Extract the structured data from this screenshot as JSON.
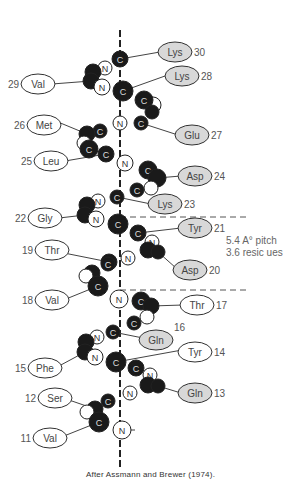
{
  "caption": "After Assmann and Brewer (1974).",
  "annotation": {
    "line1": "5.4 A° pitch",
    "line2": "3.6 resic ues"
  },
  "colors": {
    "hydrophobic_fill": "#ffffff",
    "hydrophilic_fill": "#d8d8d8",
    "atom_dark": "#1a1a1a",
    "line": "#444444"
  },
  "residues": [
    {
      "num": "30",
      "name": "Lys",
      "side": "right",
      "shaded": true,
      "cx": 175,
      "cy": 52,
      "num_pos": "after"
    },
    {
      "num": "28",
      "name": "Lys",
      "side": "right",
      "shaded": true,
      "cx": 182,
      "cy": 76,
      "num_pos": "after"
    },
    {
      "num": "29",
      "name": "Val",
      "side": "left",
      "shaded": false,
      "cx": 38,
      "cy": 84,
      "num_pos": "before"
    },
    {
      "num": "26",
      "name": "Met",
      "side": "left",
      "shaded": false,
      "cx": 44,
      "cy": 125,
      "num_pos": "before"
    },
    {
      "num": "27",
      "name": "Glu",
      "side": "right",
      "shaded": true,
      "cx": 192,
      "cy": 135,
      "num_pos": "after"
    },
    {
      "num": "25",
      "name": "Leu",
      "side": "left",
      "shaded": false,
      "cx": 51,
      "cy": 161,
      "num_pos": "before"
    },
    {
      "num": "24",
      "name": "Asp",
      "side": "right",
      "shaded": true,
      "cx": 195,
      "cy": 176,
      "num_pos": "after"
    },
    {
      "num": "23",
      "name": "Lys",
      "side": "right",
      "shaded": true,
      "cx": 165,
      "cy": 204,
      "num_pos": "after"
    },
    {
      "num": "22",
      "name": "Gly",
      "side": "left",
      "shaded": false,
      "cx": 45,
      "cy": 218,
      "num_pos": "before"
    },
    {
      "num": "21",
      "name": "Tyr",
      "side": "right",
      "shaded": true,
      "cx": 195,
      "cy": 228,
      "num_pos": "after"
    },
    {
      "num": "19",
      "name": "Thr",
      "side": "left",
      "shaded": false,
      "cx": 52,
      "cy": 250,
      "num_pos": "before"
    },
    {
      "num": "20",
      "name": "Asp",
      "side": "right",
      "shaded": true,
      "cx": 190,
      "cy": 270,
      "num_pos": "after"
    },
    {
      "num": "18",
      "name": "Val",
      "side": "left",
      "shaded": false,
      "cx": 52,
      "cy": 300,
      "num_pos": "before"
    },
    {
      "num": "17",
      "name": "Thr",
      "side": "right",
      "shaded": false,
      "cx": 197,
      "cy": 305,
      "num_pos": "after"
    },
    {
      "num": "16",
      "name": "Gln",
      "side": "right",
      "shaded": true,
      "cx": 156,
      "cy": 340,
      "num_pos": "above-after"
    },
    {
      "num": "14",
      "name": "Tyr",
      "side": "right",
      "shaded": false,
      "cx": 195,
      "cy": 352,
      "num_pos": "after"
    },
    {
      "num": "15",
      "name": "Phe",
      "side": "left",
      "shaded": false,
      "cx": 45,
      "cy": 368,
      "num_pos": "before"
    },
    {
      "num": "13",
      "name": "Gln",
      "side": "right",
      "shaded": true,
      "cx": 195,
      "cy": 393,
      "num_pos": "after"
    },
    {
      "num": "12",
      "name": "Ser",
      "side": "left",
      "shaded": false,
      "cx": 55,
      "cy": 398,
      "num_pos": "before"
    },
    {
      "num": "11",
      "name": "Val",
      "side": "left",
      "shaded": false,
      "cx": 50,
      "cy": 438,
      "num_pos": "before"
    }
  ],
  "atoms": [
    {
      "el": "C",
      "x": 120,
      "y": 59,
      "r": 8,
      "dark": true
    },
    {
      "el": "N",
      "x": 105,
      "y": 68,
      "r": 7,
      "dark": false
    },
    {
      "el": "",
      "x": 93,
      "y": 72,
      "r": 8,
      "dark": true
    },
    {
      "el": "",
      "x": 91,
      "y": 81,
      "r": 8,
      "dark": true
    },
    {
      "el": "N",
      "x": 102,
      "y": 87,
      "r": 8,
      "dark": false
    },
    {
      "el": "C",
      "x": 123,
      "y": 91,
      "r": 10,
      "dark": true
    },
    {
      "el": "",
      "x": 153,
      "y": 105,
      "r": 8,
      "dark": false
    },
    {
      "el": "C",
      "x": 144,
      "y": 100,
      "r": 9,
      "dark": true
    },
    {
      "el": "",
      "x": 152,
      "y": 112,
      "r": 7,
      "dark": true
    },
    {
      "el": "N",
      "x": 120,
      "y": 123,
      "r": 7,
      "dark": false
    },
    {
      "el": "C",
      "x": 141,
      "y": 123,
      "r": 7,
      "dark": true
    },
    {
      "el": "C",
      "x": 100,
      "y": 131,
      "r": 7,
      "dark": true
    },
    {
      "el": "",
      "x": 87,
      "y": 134,
      "r": 8,
      "dark": true
    },
    {
      "el": "",
      "x": 84,
      "y": 143,
      "r": 7,
      "dark": false
    },
    {
      "el": "C",
      "x": 89,
      "y": 149,
      "r": 9,
      "dark": true
    },
    {
      "el": "C",
      "x": 106,
      "y": 154,
      "r": 8,
      "dark": true
    },
    {
      "el": "N",
      "x": 125,
      "y": 163,
      "r": 8,
      "dark": false
    },
    {
      "el": "C",
      "x": 148,
      "y": 170,
      "r": 9,
      "dark": true
    },
    {
      "el": "",
      "x": 157,
      "y": 178,
      "r": 9,
      "dark": true
    },
    {
      "el": "",
      "x": 151,
      "y": 188,
      "r": 7,
      "dark": false
    },
    {
      "el": "C",
      "x": 137,
      "y": 190,
      "r": 7,
      "dark": true
    },
    {
      "el": "C",
      "x": 117,
      "y": 197,
      "r": 7,
      "dark": true
    },
    {
      "el": "N",
      "x": 98,
      "y": 201,
      "r": 7,
      "dark": false
    },
    {
      "el": "",
      "x": 87,
      "y": 205,
      "r": 8,
      "dark": true
    },
    {
      "el": "",
      "x": 85,
      "y": 215,
      "r": 8,
      "dark": true
    },
    {
      "el": "N",
      "x": 96,
      "y": 219,
      "r": 8,
      "dark": false
    },
    {
      "el": "C",
      "x": 118,
      "y": 224,
      "r": 10,
      "dark": true
    },
    {
      "el": "C",
      "x": 138,
      "y": 233,
      "r": 8,
      "dark": true
    },
    {
      "el": "N",
      "x": 152,
      "y": 242,
      "r": 7,
      "dark": false
    },
    {
      "el": "",
      "x": 148,
      "y": 250,
      "r": 8,
      "dark": true
    },
    {
      "el": "",
      "x": 158,
      "y": 252,
      "r": 7,
      "dark": true
    },
    {
      "el": "N",
      "x": 128,
      "y": 258,
      "r": 7,
      "dark": false
    },
    {
      "el": "",
      "x": 109,
      "y": 262,
      "r": 8,
      "dark": true
    },
    {
      "el": "C",
      "x": 108,
      "y": 264,
      "r": 7,
      "dark": true
    },
    {
      "el": "",
      "x": 92,
      "y": 273,
      "r": 8,
      "dark": true
    },
    {
      "el": "",
      "x": 86,
      "y": 276,
      "r": 7,
      "dark": false
    },
    {
      "el": "C",
      "x": 98,
      "y": 286,
      "r": 10,
      "dark": true
    },
    {
      "el": "N",
      "x": 119,
      "y": 299,
      "r": 9,
      "dark": false
    },
    {
      "el": "C",
      "x": 141,
      "y": 301,
      "r": 9,
      "dark": true
    },
    {
      "el": "",
      "x": 151,
      "y": 306,
      "r": 8,
      "dark": true
    },
    {
      "el": "",
      "x": 147,
      "y": 317,
      "r": 7,
      "dark": false
    },
    {
      "el": "C",
      "x": 134,
      "y": 323,
      "r": 7,
      "dark": true
    },
    {
      "el": "C",
      "x": 113,
      "y": 332,
      "r": 7,
      "dark": true
    },
    {
      "el": "N",
      "x": 97,
      "y": 337,
      "r": 7,
      "dark": false
    },
    {
      "el": "",
      "x": 86,
      "y": 342,
      "r": 8,
      "dark": true
    },
    {
      "el": "",
      "x": 85,
      "y": 352,
      "r": 8,
      "dark": true
    },
    {
      "el": "N",
      "x": 95,
      "y": 357,
      "r": 8,
      "dark": false
    },
    {
      "el": "C",
      "x": 116,
      "y": 362,
      "r": 10,
      "dark": true
    },
    {
      "el": "C",
      "x": 136,
      "y": 368,
      "r": 8,
      "dark": true
    },
    {
      "el": "N",
      "x": 150,
      "y": 375,
      "r": 7,
      "dark": false
    },
    {
      "el": "",
      "x": 148,
      "y": 385,
      "r": 8,
      "dark": true
    },
    {
      "el": "",
      "x": 158,
      "y": 386,
      "r": 7,
      "dark": true
    },
    {
      "el": "N",
      "x": 130,
      "y": 393,
      "r": 7,
      "dark": false
    },
    {
      "el": "C",
      "x": 108,
      "y": 401,
      "r": 7,
      "dark": true
    },
    {
      "el": "",
      "x": 95,
      "y": 409,
      "r": 8,
      "dark": true
    },
    {
      "el": "",
      "x": 87,
      "y": 412,
      "r": 7,
      "dark": false
    },
    {
      "el": "C",
      "x": 99,
      "y": 422,
      "r": 10,
      "dark": true
    },
    {
      "el": "N",
      "x": 122,
      "y": 430,
      "r": 9,
      "dark": false
    }
  ],
  "axis": {
    "x": 120,
    "y1": 30,
    "y2": 470
  },
  "pitch_lines": [
    {
      "x1": 120,
      "y1": 217,
      "x2": 250,
      "y2": 217
    },
    {
      "x1": 120,
      "y1": 290,
      "x2": 250,
      "y2": 290
    }
  ],
  "bonds": [
    {
      "from": [
        120,
        59
      ],
      "to": [
        160,
        52
      ]
    },
    {
      "from": [
        123,
        91
      ],
      "to": [
        165,
        76
      ]
    },
    {
      "from": [
        91,
        81
      ],
      "to": [
        52,
        84
      ]
    },
    {
      "from": [
        87,
        134
      ],
      "to": [
        58,
        122
      ]
    },
    {
      "from": [
        141,
        123
      ],
      "to": [
        178,
        135
      ]
    },
    {
      "from": [
        106,
        154
      ],
      "to": [
        65,
        161
      ]
    },
    {
      "from": [
        157,
        178
      ],
      "to": [
        181,
        176
      ]
    },
    {
      "from": [
        117,
        197
      ],
      "to": [
        151,
        204
      ]
    },
    {
      "from": [
        85,
        215
      ],
      "to": [
        59,
        218
      ]
    },
    {
      "from": [
        138,
        233
      ],
      "to": [
        181,
        228
      ]
    },
    {
      "from": [
        109,
        262
      ],
      "to": [
        64,
        253
      ]
    },
    {
      "from": [
        158,
        252
      ],
      "to": [
        176,
        268
      ]
    },
    {
      "from": [
        98,
        286
      ],
      "to": [
        66,
        299
      ]
    },
    {
      "from": [
        151,
        306
      ],
      "to": [
        183,
        305
      ]
    },
    {
      "from": [
        113,
        332
      ],
      "to": [
        143,
        338
      ]
    },
    {
      "from": [
        116,
        362
      ],
      "to": [
        182,
        350
      ]
    },
    {
      "from": [
        85,
        352
      ],
      "to": [
        59,
        366
      ]
    },
    {
      "from": [
        158,
        386
      ],
      "to": [
        181,
        393
      ]
    },
    {
      "from": [
        95,
        409
      ],
      "to": [
        69,
        400
      ]
    },
    {
      "from": [
        99,
        422
      ],
      "to": [
        64,
        436
      ]
    },
    {
      "from": [
        122,
        430
      ],
      "to": [
        135,
        430
      ]
    }
  ]
}
